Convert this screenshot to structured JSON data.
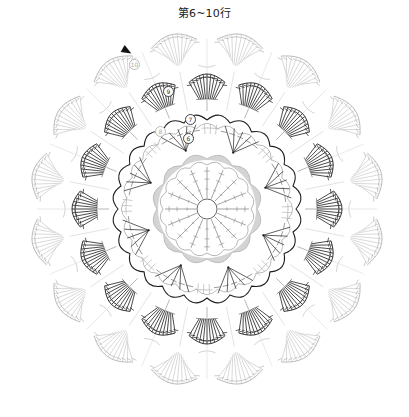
{
  "header": {
    "title": "第6~10行"
  },
  "diagram": {
    "type": "crochet-chart",
    "center": [
      207,
      209
    ],
    "colors": {
      "dark": "#1e1e1e",
      "mid": "#555555",
      "light": "#aaaaaa",
      "very_light": "#c8c8c8",
      "gray_fill": "#d4d4d4"
    },
    "rings": [
      {
        "name": "center-ring",
        "radius": 10
      },
      {
        "name": "rows-1-5",
        "radius": 48,
        "scallops": 12,
        "shaded": true,
        "spokes": 16
      },
      {
        "name": "rows-6-8",
        "inner_radius": 60,
        "outer_radius": 95,
        "scallops": 24,
        "triangle_groups": 8
      },
      {
        "name": "row-9",
        "inner_radius": 108,
        "outer_radius": 135,
        "fans": 16,
        "stitches_per_fan": 11
      },
      {
        "name": "row-10",
        "inner_radius": 138,
        "outer_radius": 178,
        "fans": 16,
        "stitches_per_fan": 11
      }
    ],
    "row_labels": [
      {
        "label": "6",
        "x": 188,
        "y": 138,
        "light": false
      },
      {
        "label": "7",
        "x": 190,
        "y": 119,
        "light": false
      },
      {
        "label": "8",
        "x": 160,
        "y": 131,
        "light": true
      },
      {
        "label": "9",
        "x": 168,
        "y": 91,
        "light": false
      },
      {
        "label": "10",
        "x": 134,
        "y": 64,
        "light": true
      }
    ],
    "start_marker": {
      "x": 128,
      "y": 51
    }
  }
}
